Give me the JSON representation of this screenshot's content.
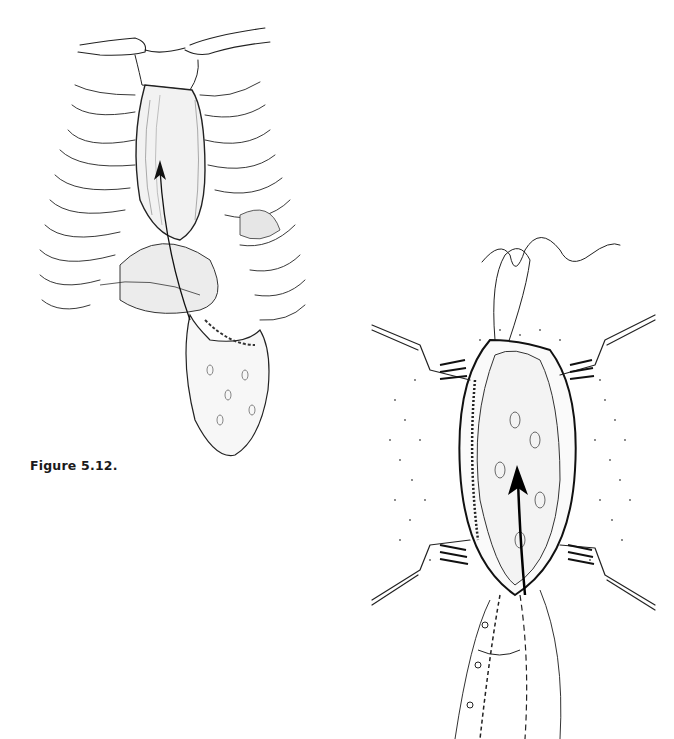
{
  "page": {
    "background": "#ffffff",
    "ink_color": "#222222"
  },
  "figure": {
    "caption": "Figure 5.12.",
    "panels": [
      {
        "id": "a",
        "description": "Anterior view of chest with ribs, clavicles and sternum removed; organ pulled up through retrosternal tunnel with arrow indicating upward direction",
        "arrow": {
          "direction": "up",
          "tip": [
            160,
            163
          ],
          "tail": [
            190,
            320
          ]
        }
      },
      {
        "id": "b",
        "description": "Operative field with four retractors, suture above, stippled surrounding tissue; graft with upward arrow and sutured vessel below",
        "arrow": {
          "direction": "up",
          "tip": [
            517,
            470
          ],
          "tail": [
            525,
            595
          ]
        }
      }
    ]
  }
}
